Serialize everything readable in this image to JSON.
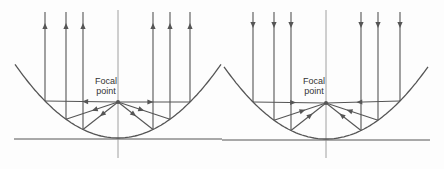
{
  "diagrams": [
    {
      "id": "left",
      "description": "Light emitted from focal point reflects off parabolic mirror into parallel outgoing rays",
      "label_line1": "Focal",
      "label_line2": "point",
      "vertex": [
        118,
        138
      ],
      "focal_length": 36,
      "x_range": [
        15,
        221
      ],
      "baseline": {
        "x1": 14,
        "x2": 222,
        "y": 139
      },
      "axis": {
        "x": 118,
        "y1": 10,
        "y2": 158
      },
      "ray_xs": [
        45,
        66,
        83,
        153,
        170,
        190
      ],
      "ray_top": 12,
      "arrow_y": 26,
      "direction": "up"
    },
    {
      "id": "right",
      "description": "Parallel incoming rays reflect off parabolic mirror and converge at focal point",
      "label_line1": "Focal",
      "label_line2": "point",
      "vertex": [
        326,
        139
      ],
      "focal_length": 36,
      "x_range": [
        224,
        428
      ],
      "baseline": {
        "x1": 222,
        "x2": 430,
        "y": 140
      },
      "axis": {
        "x": 326,
        "y1": 10,
        "y2": 158
      },
      "ray_xs": [
        253,
        274,
        291,
        361,
        378,
        400
      ],
      "ray_top": 12,
      "arrow_y": 25,
      "direction": "down"
    }
  ],
  "colors": {
    "line": "#555555",
    "text": "#333333"
  }
}
